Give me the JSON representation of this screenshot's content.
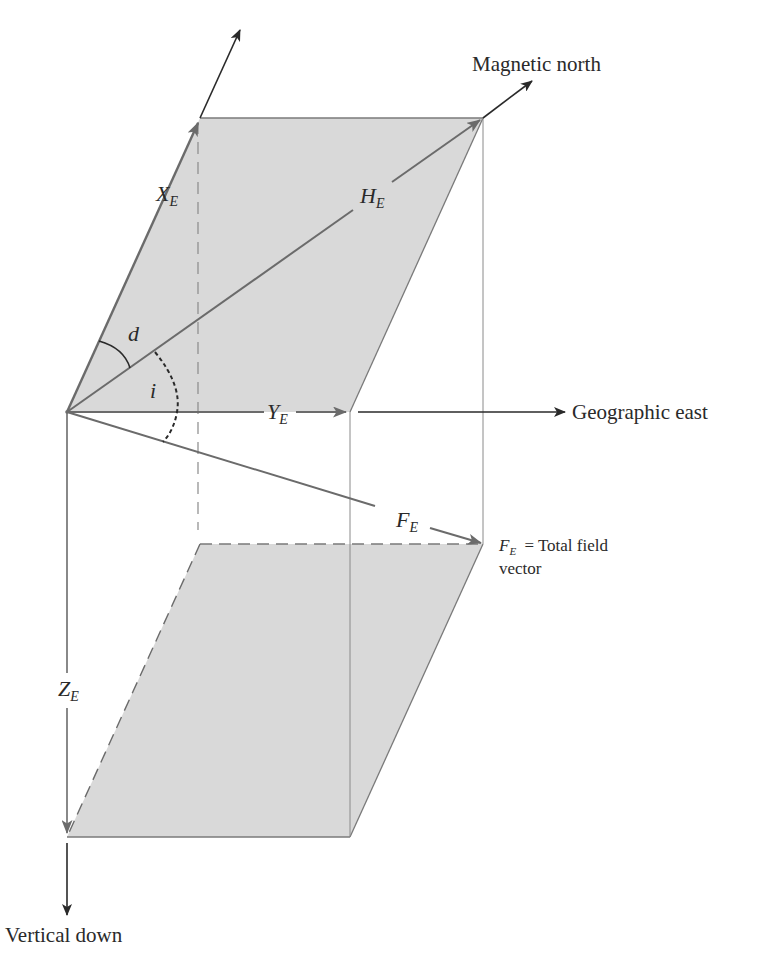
{
  "diagram": {
    "labels": {
      "magnetic_north": "Magnetic north",
      "geographic_east": "Geographic east",
      "vertical_down": "Vertical down",
      "total_field_legend_symbol": "F",
      "total_field_legend_sub": "E",
      "total_field_legend_text": "= Total field",
      "total_field_legend_text2": "vector"
    },
    "components": [
      {
        "symbol": "X",
        "sub": "E",
        "meaning": "north component"
      },
      {
        "symbol": "Y",
        "sub": "E",
        "meaning": "east component"
      },
      {
        "symbol": "Z",
        "sub": "E",
        "meaning": "vertical component"
      },
      {
        "symbol": "H",
        "sub": "E",
        "meaning": "horizontal component"
      },
      {
        "symbol": "F",
        "sub": "E",
        "meaning": "total field vector"
      }
    ],
    "angles": [
      {
        "symbol": "d",
        "meaning": "declination"
      },
      {
        "symbol": "i",
        "meaning": "inclination"
      }
    ],
    "colors": {
      "plane_fill": "#d9d9d9",
      "vector_gray": "#6b6b6b",
      "axis_black": "#2a2a2a",
      "guide_line": "#8a8a8a"
    }
  }
}
